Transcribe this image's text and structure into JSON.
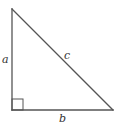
{
  "diagram": {
    "type": "right-triangle",
    "labels": {
      "a": "a",
      "b": "b",
      "c": "c"
    },
    "vertices": {
      "top": [
        12,
        9
      ],
      "bottom_left": [
        12,
        110
      ],
      "bottom_right": [
        113,
        110
      ]
    },
    "right_angle_marker": {
      "x": 12,
      "y": 99,
      "size": 11
    },
    "colors": {
      "line": "#555555",
      "text": "#333333",
      "background": "#ffffff"
    }
  }
}
